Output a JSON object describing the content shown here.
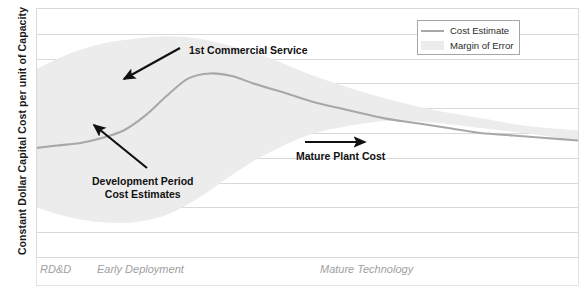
{
  "chart_data": {
    "type": "line",
    "title": "",
    "xlabel": "",
    "ylabel": "Constant Dollar Capital Cost per unit of Capacity",
    "grid": true,
    "legend_position": "top-right",
    "xlim": [
      0,
      100
    ],
    "ylim": [
      0,
      100
    ],
    "x_category_labels": [
      "RD&D",
      "Early Deployment",
      "Mature Technology"
    ],
    "series": [
      {
        "name": "Cost Estimate",
        "color": "#a8a8a8",
        "x": [
          0,
          4,
          8,
          12,
          16,
          20,
          24,
          28,
          32,
          36,
          40,
          46,
          52,
          58,
          64,
          70,
          76,
          82,
          88,
          94,
          100
        ],
        "values": [
          44,
          45,
          46,
          48,
          51,
          57,
          65,
          72,
          74,
          73,
          70,
          66,
          62,
          59,
          56,
          54,
          52,
          50,
          49,
          48,
          47
        ]
      },
      {
        "name": "Margin of Error",
        "color": "#ececec",
        "x": [
          0,
          6,
          12,
          18,
          24,
          30,
          36,
          42,
          50,
          58,
          66,
          74,
          82,
          90,
          100
        ],
        "upper": [
          76,
          82,
          86,
          88,
          89,
          88,
          85,
          81,
          74,
          68,
          63,
          59,
          56,
          53,
          51
        ],
        "lower": [
          20,
          16,
          14,
          14,
          17,
          24,
          33,
          41,
          49,
          53,
          55,
          54,
          52,
          50,
          47
        ]
      }
    ],
    "gridline_count": 10
  },
  "axis": {
    "y_title": "Constant Dollar Capital Cost per unit of Capacity",
    "x_categories": [
      {
        "label": "RD&D",
        "x_px": 40
      },
      {
        "label": "Early Deployment",
        "x_px": 97
      },
      {
        "label": "Mature Technology",
        "x_px": 320
      }
    ]
  },
  "legend": {
    "items": [
      {
        "label": "Cost Estimate",
        "marker": "line",
        "color": "#a8a8a8"
      },
      {
        "label": "Margin of Error",
        "marker": "fill",
        "color": "#ececec"
      }
    ]
  },
  "annotations": [
    {
      "name": "first-commercial-service",
      "text": "1st Commercial Service",
      "text_x": 189,
      "text_y": 44,
      "arrow": {
        "x1": 180,
        "y1": 48,
        "x2": 124,
        "y2": 79
      }
    },
    {
      "name": "development-period-cost-estimates",
      "line1": "Development Period",
      "line2": "Cost Estimates",
      "text_x": 97,
      "text_y": 175,
      "arrow": {
        "x1": 147,
        "y1": 168,
        "x2": 94,
        "y2": 125
      }
    },
    {
      "name": "mature-plant-cost",
      "text": "Mature Plant Cost",
      "text_x": 296,
      "text_y": 150,
      "arrow": {
        "x1": 305,
        "y1": 142,
        "x2": 365,
        "y2": 142
      }
    }
  ],
  "colors": {
    "curve": "#a8a8a8",
    "band": "#ececec",
    "grid": "#d9d9d9",
    "frame": "#d9d9d9",
    "annotation_text": "#111111",
    "axis_label_text": "#a0a0a0",
    "y_title_text": "#1a1a1a"
  }
}
